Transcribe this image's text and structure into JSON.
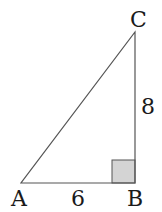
{
  "diagram": {
    "type": "right-triangle",
    "vertices": [
      {
        "name": "A",
        "label": "A"
      },
      {
        "name": "B",
        "label": "B"
      },
      {
        "name": "C",
        "label": "C"
      }
    ],
    "sides": {
      "AB": "6",
      "BC": "8"
    },
    "right_angle_at": "B",
    "colors": {
      "stroke": "#555555",
      "right_angle_fill": "#d4d4d4"
    }
  }
}
